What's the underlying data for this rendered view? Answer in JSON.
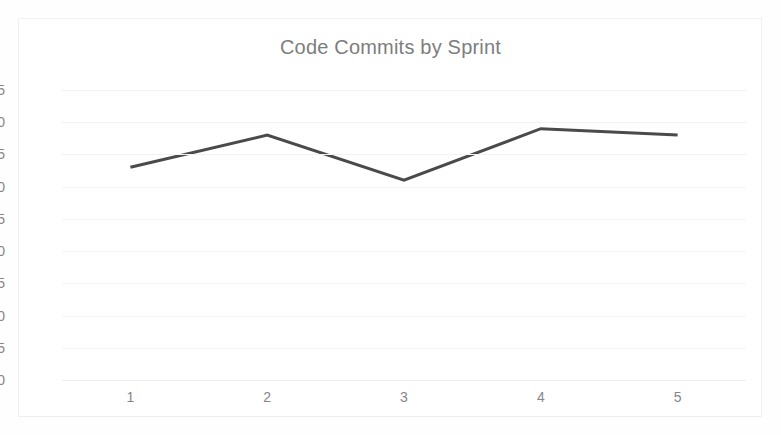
{
  "chart_data": {
    "type": "line",
    "title": "Code Commits by Sprint",
    "xlabel": "",
    "ylabel": "",
    "categories": [
      "1",
      "2",
      "3",
      "4",
      "5"
    ],
    "values": [
      33,
      38,
      31,
      39,
      38
    ],
    "series": [
      {
        "name": "Code Commits",
        "values": [
          33,
          38,
          31,
          39,
          38
        ]
      }
    ],
    "ylim": [
      0,
      45
    ],
    "ytick_interval": 5,
    "yticks": [
      45,
      40,
      35,
      30,
      25,
      20,
      15,
      10,
      5,
      0
    ],
    "xticks": [
      "1",
      "2",
      "3",
      "4",
      "5"
    ],
    "grid": true,
    "grid_axis": "y",
    "legend": false,
    "legend_position": "none",
    "line_color": "#4a4a4a",
    "line_width": 3,
    "markers": false,
    "background_color": "#ffffff",
    "title_color": "#7d7d7d",
    "tick_label_color": "#868686",
    "gridline_color": "#f2f2f2",
    "border_color": "#f0f0f0"
  }
}
